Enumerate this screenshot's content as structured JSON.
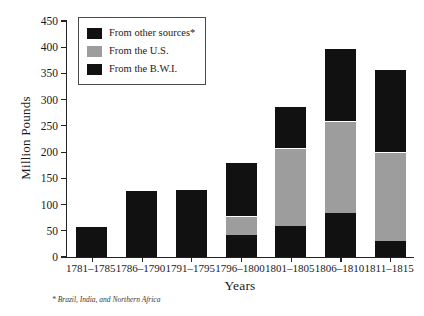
{
  "chart_data": {
    "type": "bar",
    "subtype": "stacked-vertical",
    "title": "",
    "xlabel": "Years",
    "ylabel": "Million Pounds",
    "ylim": [
      0,
      450
    ],
    "ytick_step": 50,
    "yticks": [
      0,
      50,
      100,
      150,
      200,
      250,
      300,
      350,
      400,
      450
    ],
    "ytick_labels": [
      "0",
      "50",
      "100",
      "150",
      "200",
      "250",
      "300",
      "350",
      "400",
      "450"
    ],
    "grid": false,
    "legend_position": "top-left-inside",
    "categories": [
      "1781–1785",
      "1786–1790",
      "1791–1795",
      "1796–1800",
      "1801–1805",
      "1806–1810",
      "1811–1815"
    ],
    "series": [
      {
        "name": "From the B.W.I.",
        "key": "bwi",
        "color": "#111111",
        "stack_order": 0,
        "values": [
          57,
          55,
          55,
          42,
          60,
          83,
          30
        ]
      },
      {
        "name": "From the U.S.",
        "key": "us",
        "color": "#9d9d9d",
        "stack_order": 1,
        "values": [
          0,
          0,
          0,
          36,
          147,
          177,
          170
        ]
      },
      {
        "name": "From other sources*",
        "key": "other",
        "color": "#111111",
        "stack_order": 2,
        "values": [
          0,
          73,
          75,
          104,
          81,
          139,
          159
        ]
      }
    ],
    "totals": [
      57,
      128,
      130,
      182,
      288,
      399,
      359
    ],
    "footnote": "* Brazil, India, and Northern Africa",
    "colors": {
      "bwi": "#111111",
      "us": "#9d9d9d",
      "other": "#111111",
      "axis": "#222222",
      "background": "#ffffff"
    }
  },
  "legend": {
    "items": [
      {
        "label": "From other sources*",
        "swatch_color": "#111111"
      },
      {
        "label": "From the U.S.",
        "swatch_color": "#9d9d9d"
      },
      {
        "label": "From the B.W.I.",
        "swatch_color": "#111111"
      }
    ]
  }
}
